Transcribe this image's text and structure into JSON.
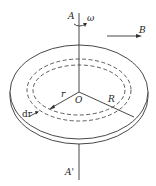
{
  "figure": {
    "type": "rotating disk in magnetic field",
    "labels": {
      "axis_top": "A",
      "axis_bottom": "A'",
      "angular_velocity": "ω",
      "field": "B",
      "center": "O",
      "radius_small": "r",
      "radius_large": "R",
      "ring_width": "dr"
    },
    "colors": {
      "stroke": "#333333",
      "background": "#ffffff"
    }
  }
}
